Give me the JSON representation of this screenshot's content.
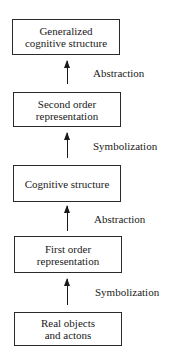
{
  "diagram": {
    "type": "vertical-flow",
    "nodes": [
      {
        "id": "generalized",
        "lines": [
          "Generalized",
          "cognitive structure"
        ]
      },
      {
        "id": "second-order",
        "lines": [
          "Second order",
          "representation"
        ]
      },
      {
        "id": "cognitive",
        "lines": [
          "Cognitive structure"
        ]
      },
      {
        "id": "first-order",
        "lines": [
          "First order",
          "representation"
        ]
      },
      {
        "id": "real",
        "lines": [
          "Real objects",
          "and actons"
        ]
      }
    ],
    "edges": [
      {
        "from": "second-order",
        "to": "generalized",
        "label": "Abstraction"
      },
      {
        "from": "cognitive",
        "to": "second-order",
        "label": "Symbolization"
      },
      {
        "from": "first-order",
        "to": "cognitive",
        "label": "Abstraction"
      },
      {
        "from": "real",
        "to": "first-order",
        "label": "Symbolization"
      }
    ]
  }
}
